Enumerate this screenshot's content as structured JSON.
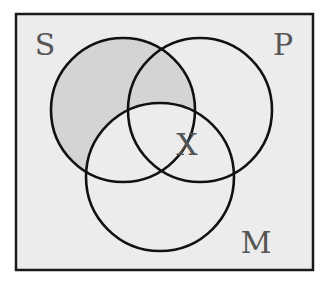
{
  "diagram": {
    "type": "venn-3",
    "frame": {
      "x": 16,
      "y": 14,
      "width": 297,
      "height": 256,
      "fill": "#ececec",
      "stroke": "#1a1a1a"
    },
    "circles": [
      {
        "id": "S",
        "label": "S",
        "cx": 123,
        "cy": 110,
        "r": 72
      },
      {
        "id": "P",
        "label": "P",
        "cx": 200,
        "cy": 110,
        "r": 72
      },
      {
        "id": "M",
        "label": "M",
        "cx": 160,
        "cy": 177,
        "r": 74
      }
    ],
    "labels": {
      "S": {
        "text": "S",
        "x": 45,
        "y": 55
      },
      "P": {
        "text": "P",
        "x": 283,
        "y": 55
      },
      "M": {
        "text": "M",
        "x": 256,
        "y": 253
      },
      "X": {
        "text": "X",
        "x": 187,
        "y": 155
      }
    },
    "shaded_region": "S minus M",
    "shade_color": "#d4d4d4",
    "marker": {
      "text": "X",
      "region": "S ∩ P ∩ M (on S boundary, inside P and M)"
    }
  }
}
